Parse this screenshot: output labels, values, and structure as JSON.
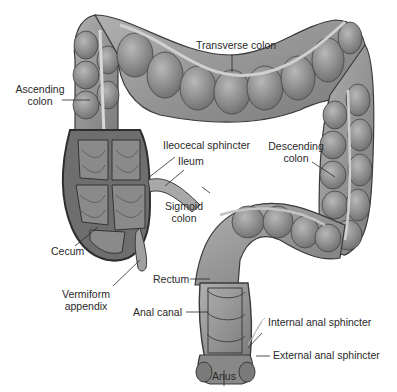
{
  "diagram": {
    "colors": {
      "tissue": "#8e8e8e",
      "tissue_dark": "#5a5a5a",
      "tissue_light": "#b4b4b4",
      "outline": "#3a3a3a",
      "background": "#ffffff",
      "text": "#2a2a2a"
    },
    "labels": {
      "transverse_colon": "Transverse colon",
      "ascending_colon_1": "Ascending",
      "ascending_colon_2": "colon",
      "ileocecal_sphincter": "Ileocecal sphincter",
      "ileum": "Ileum",
      "descending_colon_1": "Descending",
      "descending_colon_2": "colon",
      "sigmoid_colon_1": "Sigmoid",
      "sigmoid_colon_2": "colon",
      "cecum": "Cecum",
      "rectum": "Rectum",
      "vermiform_appendix_1": "Vermiform",
      "vermiform_appendix_2": "appendix",
      "anal_canal": "Anal canal",
      "internal_anal_sphincter": "Internal anal sphincter",
      "external_anal_sphincter": "External anal sphincter",
      "anus": "Anus"
    }
  }
}
